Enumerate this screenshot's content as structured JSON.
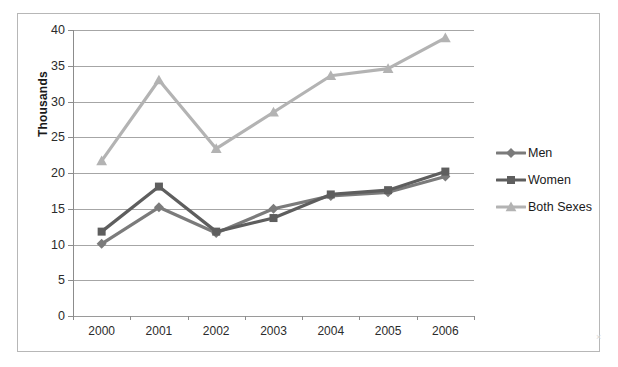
{
  "chart_data": {
    "type": "line",
    "title": "",
    "xlabel": "",
    "ylabel": "Thousands",
    "categories": [
      "2000",
      "2001",
      "2002",
      "2003",
      "2004",
      "2005",
      "2006"
    ],
    "ylim": [
      0,
      40
    ],
    "y_ticks": [
      0,
      5,
      10,
      15,
      20,
      25,
      30,
      35,
      40
    ],
    "y_tick_labels": [
      "0",
      "5",
      "10",
      "15",
      "20",
      "25",
      "30",
      "35",
      "40"
    ],
    "grid": true,
    "legend_position": "right",
    "series": [
      {
        "name": "Men",
        "color": "#7b7b7b",
        "marker": "diamond",
        "values": [
          10.1,
          15.2,
          11.6,
          15.0,
          16.8,
          17.3,
          19.5
        ]
      },
      {
        "name": "Women",
        "color": "#5e5e5e",
        "marker": "square",
        "values": [
          11.8,
          18.1,
          11.8,
          13.7,
          17.0,
          17.6,
          20.2
        ]
      },
      {
        "name": "Both Sexes",
        "color": "#b3b3b3",
        "marker": "triangle",
        "values": [
          21.7,
          33.0,
          23.4,
          28.5,
          33.6,
          34.6,
          38.9
        ]
      }
    ]
  },
  "legend": {
    "items": [
      {
        "label": "Men"
      },
      {
        "label": "Women"
      },
      {
        "label": "Both Sexes"
      }
    ]
  },
  "colors": {
    "men": "#7b7b7b",
    "women": "#5e5e5e",
    "both_sexes": "#b3b3b3",
    "gridline": "#a6a6a6",
    "axis": "#8c8c8c",
    "frame_border": "#b7b7b7",
    "text": "#1a1a1a",
    "background": "#ffffff"
  },
  "scan_artifact": "×"
}
